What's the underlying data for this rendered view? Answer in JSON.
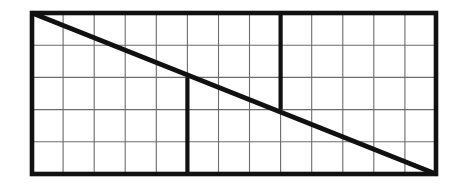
{
  "figure": {
    "title": "Rectangular grid with diagonal and two thick partition segments",
    "background_color": "#ffffff",
    "thin_line_color": "#6b6b6b",
    "thick_line_color": "#111111",
    "border_color": "#111111",
    "thin_line_width": 1.1,
    "thick_line_width": 4.2,
    "border_line_width": 4.6,
    "diagonal_line_width": 4.6
  },
  "chart_data": {
    "type": "diagram",
    "title": "Rectangular grid with diagonal and two thick partition segments",
    "grid": {
      "columns": 13,
      "rows": 5,
      "x_left": 32,
      "x_right": 436,
      "y_top": 13,
      "y_bottom": 174,
      "cell_width": 31.08,
      "cell_height": 32.2,
      "vertical_line_x": [
        32,
        63.1,
        94.2,
        125.2,
        156.3,
        187.4,
        218.5,
        249.5,
        280.6,
        311.7,
        342.8,
        373.8,
        404.9,
        436
      ],
      "horizontal_line_y": [
        13,
        45.2,
        77.4,
        109.6,
        141.8,
        174
      ]
    },
    "diagonal": {
      "label": "main-diagonal",
      "x1": 32,
      "y1": 13,
      "x2": 436,
      "y2": 174,
      "from": "top-left-corner",
      "to": "bottom-right-corner"
    },
    "thick_segments": [
      {
        "label": "left-partition",
        "orientation": "vertical",
        "x": 187.4,
        "y1": 77.4,
        "y2": 174,
        "spans_rows": "3-5"
      },
      {
        "label": "right-partition",
        "orientation": "vertical",
        "x": 280.6,
        "y1": 13,
        "y2": 109.6,
        "spans_rows": "1-3"
      }
    ],
    "xlabel": "",
    "ylabel": "",
    "legend": [],
    "annotations": []
  }
}
